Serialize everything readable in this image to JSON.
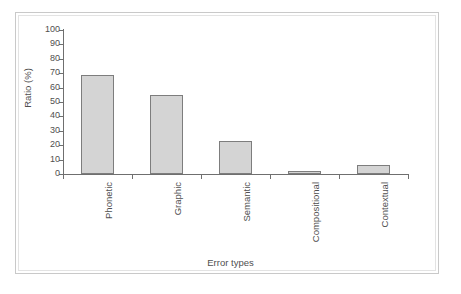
{
  "chart_data": {
    "type": "bar",
    "title": "",
    "subtitle": "",
    "xlabel": "Error types",
    "ylabel": "Ratio (%)",
    "categories": [
      "Phonetic",
      "Graphic",
      "Semantic",
      "Compositional",
      "Contextual"
    ],
    "values": [
      69,
      55,
      23,
      2,
      6
    ],
    "ylim": [
      0,
      100
    ],
    "yticks": [
      "0",
      "10",
      "20",
      "30",
      "40",
      "50",
      "60",
      "70",
      "80",
      "90",
      "100"
    ],
    "ytick_values": [
      0,
      10,
      20,
      30,
      40,
      50,
      60,
      70,
      80,
      90,
      100
    ],
    "grid": false,
    "legend": false,
    "legend_position": "none",
    "series": [
      {
        "name": "Ratio (%)",
        "values": [
          69,
          55,
          23,
          2,
          6
        ]
      }
    ],
    "bar_fill_color": "#d4d4d4",
    "bar_pattern": "fine-dotted",
    "bar_border_color": "#7d7d7d",
    "axis_color": "#6f6f6f",
    "text_color": "#4f4f4f",
    "xtick_label_rotation": "90",
    "frame_color": "#c9c9c9",
    "background_color": "#ffffff"
  }
}
